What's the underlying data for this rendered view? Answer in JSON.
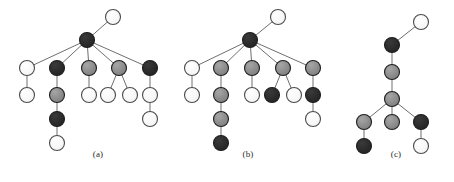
{
  "figure": {
    "background_color": "#ffffff",
    "width": 454,
    "height": 182
  },
  "palette": {
    "white": "#ffffff",
    "light_gray": "#a8a8a8",
    "mid_gray": "#8a8a8a",
    "dark": "#2b2b2b",
    "outline": "#4a4a4a",
    "edge": "#6e6e6e"
  },
  "node_style": {
    "radius": 7.5,
    "stroke_width": 1.1,
    "edge_width": 1.0
  },
  "panels": [
    {
      "id": "a",
      "caption": "(a)",
      "caption_x": 98,
      "caption_y": 156,
      "nodes": [
        {
          "id": "a0",
          "name": "top-white",
          "x": 113,
          "y": 17,
          "fill": "#ffffff"
        },
        {
          "id": "a1",
          "name": "root-dark",
          "x": 87,
          "y": 40,
          "fill": "#2b2b2b"
        },
        {
          "id": "a2",
          "name": "child1-white",
          "x": 27,
          "y": 68,
          "fill": "#ffffff"
        },
        {
          "id": "a3",
          "name": "child1-leaf-white",
          "x": 27,
          "y": 95,
          "fill": "#ffffff"
        },
        {
          "id": "a4",
          "name": "child2-dark",
          "x": 57,
          "y": 68,
          "fill": "#2b2b2b"
        },
        {
          "id": "a5",
          "name": "chain-gray",
          "x": 57,
          "y": 95,
          "fill": "#8a8a8a"
        },
        {
          "id": "a6",
          "name": "chain-dark",
          "x": 57,
          "y": 119,
          "fill": "#2b2b2b"
        },
        {
          "id": "a7",
          "name": "chain-leaf-white",
          "x": 57,
          "y": 143,
          "fill": "#ffffff"
        },
        {
          "id": "a8",
          "name": "child3-gray",
          "x": 89,
          "y": 68,
          "fill": "#8a8a8a"
        },
        {
          "id": "a9",
          "name": "child3-leaf-white",
          "x": 89,
          "y": 95,
          "fill": "#ffffff"
        },
        {
          "id": "a10",
          "name": "child4-gray",
          "x": 119,
          "y": 68,
          "fill": "#8a8a8a"
        },
        {
          "id": "a11",
          "name": "child4-leafA-white",
          "x": 108,
          "y": 95,
          "fill": "#ffffff"
        },
        {
          "id": "a12",
          "name": "child4-leafB-white",
          "x": 130,
          "y": 95,
          "fill": "#ffffff"
        },
        {
          "id": "a13",
          "name": "child5-dark",
          "x": 150,
          "y": 68,
          "fill": "#2b2b2b"
        },
        {
          "id": "a14",
          "name": "child5-mid-white",
          "x": 150,
          "y": 95,
          "fill": "#ffffff"
        },
        {
          "id": "a15",
          "name": "child5-leaf-white",
          "x": 150,
          "y": 119,
          "fill": "#ffffff"
        }
      ],
      "edges": [
        [
          "a1",
          "a0"
        ],
        [
          "a1",
          "a2"
        ],
        [
          "a1",
          "a4"
        ],
        [
          "a1",
          "a8"
        ],
        [
          "a1",
          "a10"
        ],
        [
          "a1",
          "a13"
        ],
        [
          "a2",
          "a3"
        ],
        [
          "a4",
          "a5"
        ],
        [
          "a5",
          "a6"
        ],
        [
          "a6",
          "a7"
        ],
        [
          "a8",
          "a9"
        ],
        [
          "a10",
          "a11"
        ],
        [
          "a10",
          "a12"
        ],
        [
          "a13",
          "a14"
        ],
        [
          "a14",
          "a15"
        ]
      ]
    },
    {
      "id": "b",
      "caption": "(b)",
      "caption_x": 248,
      "caption_y": 156,
      "nodes": [
        {
          "id": "b0",
          "name": "top-white",
          "x": 278,
          "y": 17,
          "fill": "#ffffff"
        },
        {
          "id": "b1",
          "name": "root-dark",
          "x": 250,
          "y": 40,
          "fill": "#2b2b2b"
        },
        {
          "id": "b2",
          "name": "child1-white",
          "x": 192,
          "y": 68,
          "fill": "#ffffff"
        },
        {
          "id": "b3",
          "name": "child1-leaf-white",
          "x": 192,
          "y": 95,
          "fill": "#ffffff"
        },
        {
          "id": "b4",
          "name": "child2-gray",
          "x": 221,
          "y": 68,
          "fill": "#8a8a8a"
        },
        {
          "id": "b5",
          "name": "chain-gray-2",
          "x": 221,
          "y": 95,
          "fill": "#8a8a8a"
        },
        {
          "id": "b6",
          "name": "chain-gray-3",
          "x": 221,
          "y": 119,
          "fill": "#8a8a8a"
        },
        {
          "id": "b7",
          "name": "chain-leaf-dark",
          "x": 221,
          "y": 143,
          "fill": "#2b2b2b"
        },
        {
          "id": "b8",
          "name": "child3-gray",
          "x": 252,
          "y": 68,
          "fill": "#8a8a8a"
        },
        {
          "id": "b9",
          "name": "child3-leaf-white",
          "x": 252,
          "y": 95,
          "fill": "#ffffff"
        },
        {
          "id": "b10",
          "name": "child4-gray",
          "x": 283,
          "y": 68,
          "fill": "#8a8a8a"
        },
        {
          "id": "b11",
          "name": "child4-leafA-dark",
          "x": 272,
          "y": 95,
          "fill": "#2b2b2b"
        },
        {
          "id": "b12",
          "name": "child4-leafB-white",
          "x": 294,
          "y": 95,
          "fill": "#ffffff"
        },
        {
          "id": "b13",
          "name": "child5-gray",
          "x": 313,
          "y": 68,
          "fill": "#8a8a8a"
        },
        {
          "id": "b14",
          "name": "child5-mid-dark",
          "x": 313,
          "y": 95,
          "fill": "#2b2b2b"
        },
        {
          "id": "b15",
          "name": "child5-leaf-white",
          "x": 313,
          "y": 119,
          "fill": "#ffffff"
        }
      ],
      "edges": [
        [
          "b1",
          "b0"
        ],
        [
          "b1",
          "b2"
        ],
        [
          "b1",
          "b4"
        ],
        [
          "b1",
          "b8"
        ],
        [
          "b1",
          "b10"
        ],
        [
          "b1",
          "b13"
        ],
        [
          "b2",
          "b3"
        ],
        [
          "b4",
          "b5"
        ],
        [
          "b5",
          "b6"
        ],
        [
          "b6",
          "b7"
        ],
        [
          "b8",
          "b9"
        ],
        [
          "b10",
          "b11"
        ],
        [
          "b10",
          "b12"
        ],
        [
          "b13",
          "b14"
        ],
        [
          "b14",
          "b15"
        ]
      ]
    },
    {
      "id": "c",
      "caption": "(c)",
      "caption_x": 396,
      "caption_y": 156,
      "nodes": [
        {
          "id": "c0",
          "name": "top-white",
          "x": 421,
          "y": 22,
          "fill": "#ffffff"
        },
        {
          "id": "c1",
          "name": "root-dark",
          "x": 392,
          "y": 45,
          "fill": "#2b2b2b"
        },
        {
          "id": "c2",
          "name": "spine-gray-1",
          "x": 392,
          "y": 72,
          "fill": "#8a8a8a"
        },
        {
          "id": "c3",
          "name": "spine-gray-2",
          "x": 392,
          "y": 99,
          "fill": "#8a8a8a"
        },
        {
          "id": "c4",
          "name": "branch-left-gray",
          "x": 364,
          "y": 122,
          "fill": "#8a8a8a"
        },
        {
          "id": "c5",
          "name": "branch-left-leaf-dark",
          "x": 364,
          "y": 146,
          "fill": "#2b2b2b"
        },
        {
          "id": "c6",
          "name": "branch-mid-gray",
          "x": 392,
          "y": 122,
          "fill": "#8a8a8a"
        },
        {
          "id": "c7",
          "name": "branch-right-dark",
          "x": 421,
          "y": 122,
          "fill": "#2b2b2b"
        },
        {
          "id": "c8",
          "name": "branch-right-leaf-white",
          "x": 421,
          "y": 146,
          "fill": "#ffffff"
        }
      ],
      "edges": [
        [
          "c1",
          "c0"
        ],
        [
          "c1",
          "c2"
        ],
        [
          "c2",
          "c3"
        ],
        [
          "c3",
          "c4"
        ],
        [
          "c3",
          "c6"
        ],
        [
          "c3",
          "c7"
        ],
        [
          "c4",
          "c5"
        ],
        [
          "c7",
          "c8"
        ]
      ]
    }
  ]
}
